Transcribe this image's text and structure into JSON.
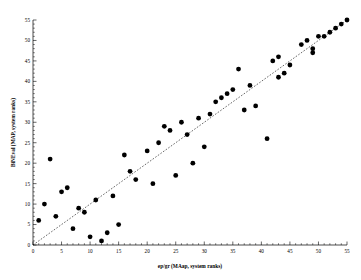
{
  "chart_data": {
    "type": "scatter",
    "title": "",
    "xlabel": "ep/gr (MAap, system ranks)",
    "ylabel": "BiNEval (MAP, system ranks)",
    "xlim": [
      0,
      55
    ],
    "ylim": [
      0,
      55
    ],
    "xticks": [
      0,
      5,
      10,
      15,
      20,
      25,
      30,
      35,
      40,
      45,
      50,
      55
    ],
    "yticks": [
      0,
      5,
      10,
      15,
      20,
      25,
      30,
      35,
      40,
      45,
      50,
      55
    ],
    "xtick_labels": [
      "0",
      "5",
      "10",
      "15",
      "20",
      "25",
      "30",
      "35",
      "40",
      "45",
      "50",
      "55"
    ],
    "ytick_labels": [
      "0",
      "5",
      "10",
      "15",
      "20",
      "25",
      "30",
      "35",
      "40",
      "45",
      "50",
      "55"
    ],
    "grid": false,
    "legend": null,
    "marker_color": "#000000",
    "marker_size": 2.4,
    "reference_line": {
      "style": "dashed",
      "x": [
        0,
        55
      ],
      "y": [
        0,
        55
      ],
      "label": "diagonal reference (y = x)"
    },
    "points": [
      [
        1,
        6
      ],
      [
        2,
        10
      ],
      [
        3,
        21
      ],
      [
        4,
        7
      ],
      [
        5,
        13
      ],
      [
        6,
        14
      ],
      [
        7,
        4
      ],
      [
        8,
        9
      ],
      [
        9,
        8
      ],
      [
        10,
        2
      ],
      [
        11,
        11
      ],
      [
        12,
        1
      ],
      [
        13,
        3
      ],
      [
        14,
        12
      ],
      [
        15,
        5
      ],
      [
        16,
        22
      ],
      [
        17,
        18
      ],
      [
        18,
        16
      ],
      [
        20,
        23
      ],
      [
        21,
        15
      ],
      [
        22,
        25
      ],
      [
        23,
        29
      ],
      [
        24,
        28
      ],
      [
        25,
        17
      ],
      [
        26,
        30
      ],
      [
        27,
        27
      ],
      [
        28,
        20
      ],
      [
        29,
        31
      ],
      [
        30,
        24
      ],
      [
        31,
        32
      ],
      [
        32,
        35
      ],
      [
        33,
        36
      ],
      [
        34,
        37
      ],
      [
        35,
        38
      ],
      [
        36,
        43
      ],
      [
        37,
        33
      ],
      [
        38,
        39
      ],
      [
        39,
        34
      ],
      [
        41,
        26
      ],
      [
        42,
        45
      ],
      [
        43,
        46
      ],
      [
        43,
        41
      ],
      [
        44,
        42
      ],
      [
        45,
        44
      ],
      [
        47,
        49
      ],
      [
        48,
        50
      ],
      [
        49,
        48
      ],
      [
        49,
        47
      ],
      [
        50,
        51
      ],
      [
        51,
        51
      ],
      [
        52,
        52
      ],
      [
        53,
        53
      ],
      [
        54,
        54
      ],
      [
        55,
        55
      ]
    ]
  }
}
